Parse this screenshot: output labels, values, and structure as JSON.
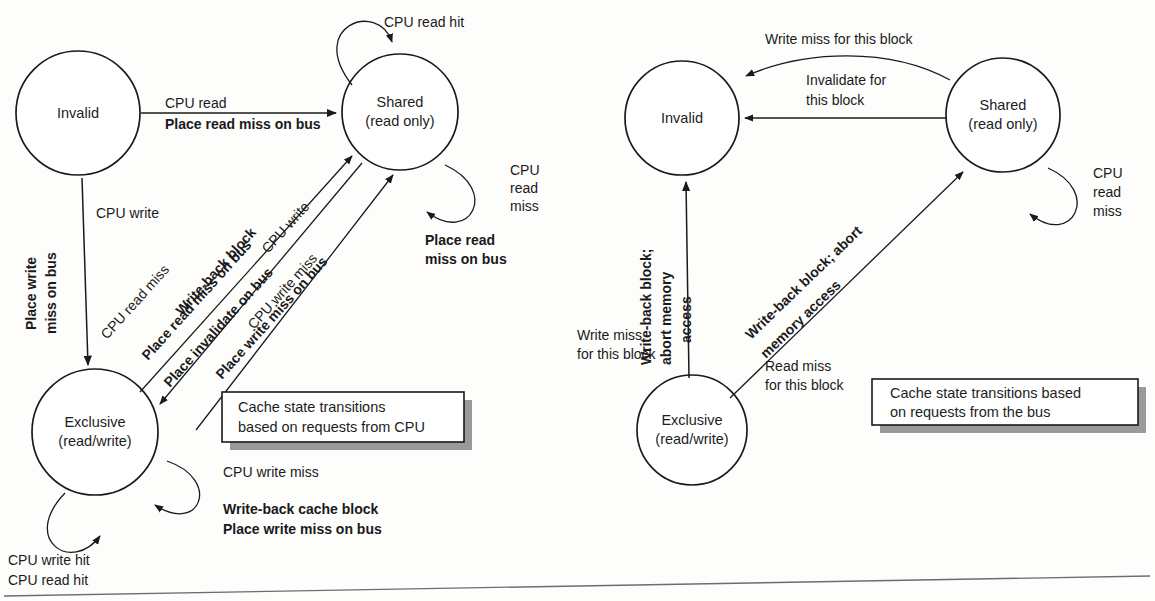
{
  "figure": {
    "colors": {
      "ink": "#1a1a1a",
      "shadow": "#8e8e8e",
      "paper": "#fdfdfc",
      "box_shadow": "#9a9a9a"
    }
  },
  "cpu_diagram": {
    "caption_line1": "Cache state transitions",
    "caption_line2": "based on requests from CPU",
    "states": [
      {
        "id": "invalid",
        "label_line1": "Invalid",
        "label_line2": ""
      },
      {
        "id": "shared",
        "label_line1": "Shared",
        "label_line2": "(read only)"
      },
      {
        "id": "exclusive",
        "label_line1": "Exclusive",
        "label_line2": "(read/write)"
      }
    ],
    "transitions": [
      {
        "id": "invalid-to-shared",
        "from": "invalid",
        "to": "shared",
        "event": "CPU read",
        "action": "Place read miss on bus"
      },
      {
        "id": "invalid-to-exclusive",
        "from": "invalid",
        "to": "exclusive",
        "event": "CPU write",
        "action_line1": "Place write",
        "action_line2": "miss on bus"
      },
      {
        "id": "exclusive-to-shared",
        "from": "exclusive",
        "to": "shared",
        "event": "CPU read miss",
        "action": "Write-back block",
        "action2": "Place read miss on bus"
      },
      {
        "id": "shared-to-exclusive",
        "from": "shared",
        "to": "exclusive",
        "event": "CPU write",
        "action": "Place invalidate on bus"
      },
      {
        "id": "exclusive-to-shared-writemiss",
        "from": "exclusive",
        "to": "shared",
        "event": "CPU write miss",
        "action": "Place write miss on bus"
      }
    ],
    "self_loops": [
      {
        "id": "shared-read-hit",
        "state": "shared",
        "event": "CPU read hit",
        "action": ""
      },
      {
        "id": "shared-read-miss",
        "state": "shared",
        "event_line1": "CPU",
        "event_line2": "read",
        "event_line3": "miss",
        "action_line1": "Place read",
        "action_line2": "miss on bus"
      },
      {
        "id": "exclusive-write-miss",
        "state": "exclusive",
        "event": "CPU write miss",
        "action_line1": "Write-back cache block",
        "action_line2": "Place write miss on bus"
      },
      {
        "id": "exclusive-hits",
        "state": "exclusive",
        "event_line1": "CPU write hit",
        "event_line2": "CPU read hit",
        "action": ""
      }
    ]
  },
  "bus_diagram": {
    "caption_line1": "Cache state transitions based",
    "caption_line2": "on requests from the bus",
    "states": [
      {
        "id": "invalid",
        "label_line1": "Invalid",
        "label_line2": ""
      },
      {
        "id": "shared",
        "label_line1": "Shared",
        "label_line2": "(read only)"
      },
      {
        "id": "exclusive",
        "label_line1": "Exclusive",
        "label_line2": "(read/write)"
      }
    ],
    "transitions": [
      {
        "id": "shared-to-invalid-writemiss",
        "from": "shared",
        "to": "invalid",
        "event": "Write miss for this block"
      },
      {
        "id": "shared-to-invalid-invalidate",
        "from": "shared",
        "to": "invalid",
        "event_line1": "Invalidate for",
        "event_line2": "this block"
      },
      {
        "id": "exclusive-to-invalid",
        "from": "exclusive",
        "to": "invalid",
        "event_line1": "Write miss",
        "event_line2": "for this block",
        "action_line1": "Write-back block;",
        "action_line2": "abort memory",
        "action_line3": "access"
      },
      {
        "id": "exclusive-to-shared",
        "from": "exclusive",
        "to": "shared",
        "event_line1": "Read miss",
        "event_line2": "for this block",
        "action_line1": "Write-back block; abort",
        "action_line2": "memory access"
      }
    ],
    "self_loops": [
      {
        "id": "shared-read-miss",
        "state": "shared",
        "event_line1": "CPU",
        "event_line2": "read",
        "event_line3": "miss"
      }
    ]
  }
}
